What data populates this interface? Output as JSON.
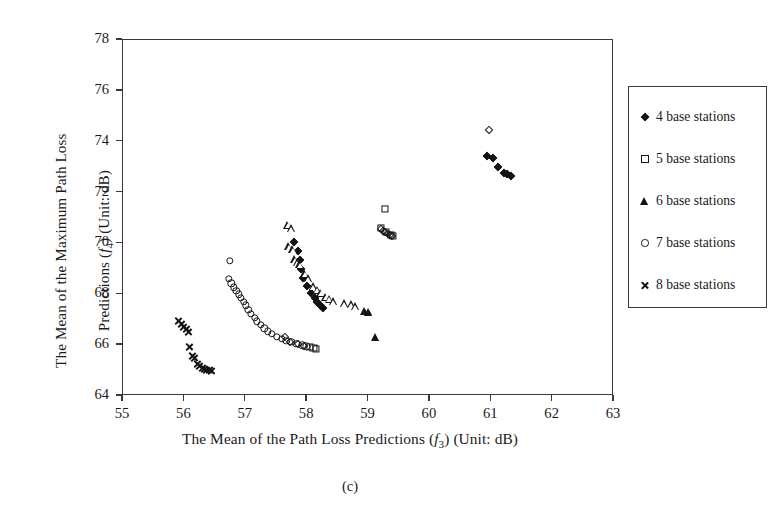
{
  "figure": {
    "subcaption": "(c)",
    "xlabel_parts": {
      "pre": "The Mean of the Path Loss Predictions (",
      "sym": "f",
      "sub": "3",
      "post": ") (Unit: dB)"
    },
    "ylabel_parts": {
      "line1": "The Mean of the Maximum Path Loss",
      "pre": "Predictions (",
      "sym": "f",
      "sub": "4",
      "post": ") (Unit: dB)"
    }
  },
  "legend": {
    "position": "right",
    "entries": [
      {
        "label": "4 base stations",
        "marker": "diamond"
      },
      {
        "label": "5 base stations",
        "marker": "square"
      },
      {
        "label": "6 base stations",
        "marker": "triangle"
      },
      {
        "label": "7 base stations",
        "marker": "circle"
      },
      {
        "label": "8 base stations",
        "marker": "cross"
      }
    ]
  },
  "chart_data": {
    "type": "scatter",
    "title": "",
    "subtitle": "(c)",
    "xlabel": "The Mean of the Path Loss Predictions (f3) (Unit: dB)",
    "ylabel": "The Mean of the Maximum Path Loss Predictions (f4) (Unit: dB)",
    "xlim": [
      55,
      63
    ],
    "ylim": [
      64,
      78
    ],
    "xticks": [
      55,
      56,
      57,
      58,
      59,
      60,
      61,
      62,
      63
    ],
    "yticks": [
      64,
      66,
      68,
      70,
      72,
      74,
      76,
      78
    ],
    "xtick_labels": [
      "55",
      "56",
      "57",
      "58",
      "59",
      "60",
      "61",
      "62",
      "63"
    ],
    "ytick_labels": [
      "64",
      "66",
      "68",
      "70",
      "72",
      "74",
      "76",
      "78"
    ],
    "grid": false,
    "legend_position": "right-outside",
    "color": "#141414",
    "series": [
      {
        "name": "4 base stations",
        "marker": "diamond",
        "points": [
          [
            60.98,
            74.42
          ],
          [
            60.95,
            73.4
          ],
          [
            61.05,
            73.33
          ],
          [
            61.12,
            72.95
          ],
          [
            61.22,
            72.72
          ],
          [
            61.28,
            72.68
          ],
          [
            61.33,
            72.62
          ],
          [
            59.22,
            70.52
          ],
          [
            59.26,
            70.44
          ],
          [
            59.29,
            70.4
          ],
          [
            59.33,
            70.34
          ],
          [
            59.36,
            70.3
          ],
          [
            59.4,
            70.26
          ],
          [
            57.8,
            70.02
          ],
          [
            57.86,
            69.66
          ],
          [
            57.9,
            69.3
          ],
          [
            57.92,
            68.96
          ],
          [
            57.95,
            68.62
          ],
          [
            58.02,
            68.3
          ],
          [
            58.08,
            68.02
          ],
          [
            58.14,
            67.82
          ],
          [
            58.18,
            67.64
          ],
          [
            58.22,
            67.52
          ],
          [
            58.28,
            67.42
          ],
          [
            57.66,
            66.28
          ],
          [
            57.74,
            66.1
          ],
          [
            57.86,
            66.0
          ],
          [
            57.96,
            65.92
          ]
        ]
      },
      {
        "name": "5 base stations",
        "marker": "square",
        "points": [
          [
            59.28,
            71.3
          ],
          [
            59.22,
            70.56
          ],
          [
            59.3,
            70.4
          ],
          [
            59.38,
            70.28
          ],
          [
            59.42,
            70.24
          ],
          [
            58.06,
            65.9
          ],
          [
            58.12,
            65.86
          ],
          [
            58.16,
            65.82
          ]
        ]
      },
      {
        "name": "6 base stations",
        "marker": "triangle",
        "points": [
          [
            57.7,
            70.7
          ],
          [
            57.76,
            70.56
          ],
          [
            57.72,
            69.86
          ],
          [
            57.78,
            69.74
          ],
          [
            57.82,
            69.34
          ],
          [
            57.86,
            69.22
          ],
          [
            57.9,
            69.14
          ],
          [
            57.98,
            68.8
          ],
          [
            58.04,
            68.6
          ],
          [
            58.12,
            68.28
          ],
          [
            58.18,
            68.14
          ],
          [
            58.24,
            68.02
          ],
          [
            58.32,
            67.86
          ],
          [
            58.38,
            67.78
          ],
          [
            58.44,
            67.7
          ],
          [
            58.62,
            67.62
          ],
          [
            58.74,
            67.56
          ],
          [
            58.8,
            67.5
          ],
          [
            58.96,
            67.32
          ],
          [
            59.02,
            67.28
          ],
          [
            59.14,
            66.28
          ]
        ]
      },
      {
        "name": "7 base stations",
        "marker": "circle",
        "points": [
          [
            56.76,
            69.28
          ],
          [
            56.74,
            68.58
          ],
          [
            56.78,
            68.4
          ],
          [
            56.82,
            68.24
          ],
          [
            56.86,
            68.1
          ],
          [
            56.9,
            67.96
          ],
          [
            56.94,
            67.82
          ],
          [
            56.98,
            67.66
          ],
          [
            57.02,
            67.52
          ],
          [
            57.06,
            67.36
          ],
          [
            57.1,
            67.2
          ],
          [
            57.16,
            67.04
          ],
          [
            57.2,
            66.9
          ],
          [
            57.26,
            66.76
          ],
          [
            57.32,
            66.62
          ],
          [
            57.38,
            66.5
          ],
          [
            57.44,
            66.4
          ],
          [
            57.52,
            66.3
          ],
          [
            57.6,
            66.22
          ],
          [
            57.68,
            66.14
          ],
          [
            57.76,
            66.08
          ],
          [
            57.84,
            66.02
          ],
          [
            57.94,
            65.96
          ],
          [
            58.0,
            65.92
          ]
        ]
      },
      {
        "name": "8 base stations",
        "marker": "cross",
        "points": [
          [
            55.92,
            66.92
          ],
          [
            55.96,
            66.8
          ],
          [
            56.0,
            66.68
          ],
          [
            56.04,
            66.58
          ],
          [
            56.08,
            66.48
          ],
          [
            56.1,
            65.9
          ],
          [
            56.14,
            65.52
          ],
          [
            56.18,
            65.44
          ],
          [
            56.22,
            65.22
          ],
          [
            56.26,
            65.14
          ],
          [
            56.3,
            65.08
          ],
          [
            56.34,
            65.04
          ],
          [
            56.38,
            65.0
          ],
          [
            56.42,
            64.98
          ],
          [
            56.46,
            64.96
          ]
        ]
      }
    ]
  }
}
